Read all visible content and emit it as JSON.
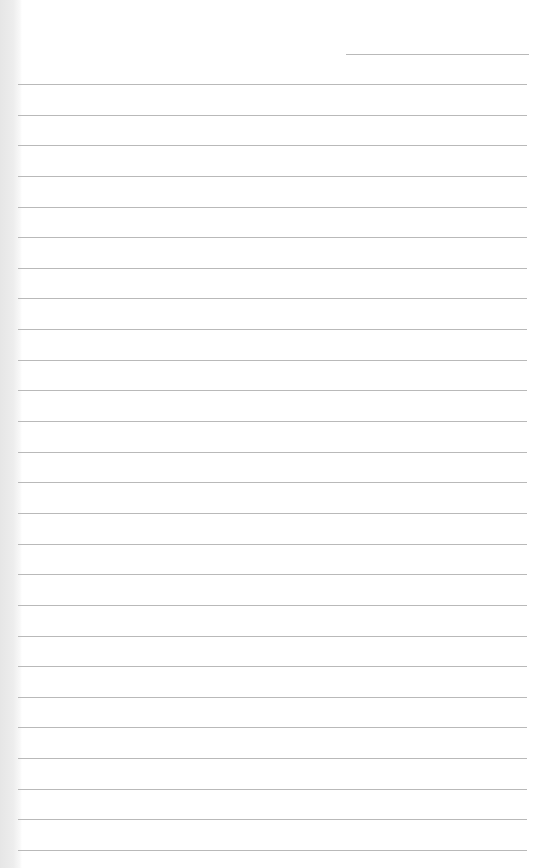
{
  "page": {
    "type": "lined-paper",
    "background_color": "#ffffff",
    "line_color": "#b9b9b9",
    "margin_color": "#e8e8e8",
    "header_line": {
      "x": 346,
      "y": 54,
      "width": 183
    },
    "ruled_lines": {
      "count": 26,
      "first_y": 84,
      "spacing": 30.64,
      "left": 18,
      "right": 527
    }
  }
}
